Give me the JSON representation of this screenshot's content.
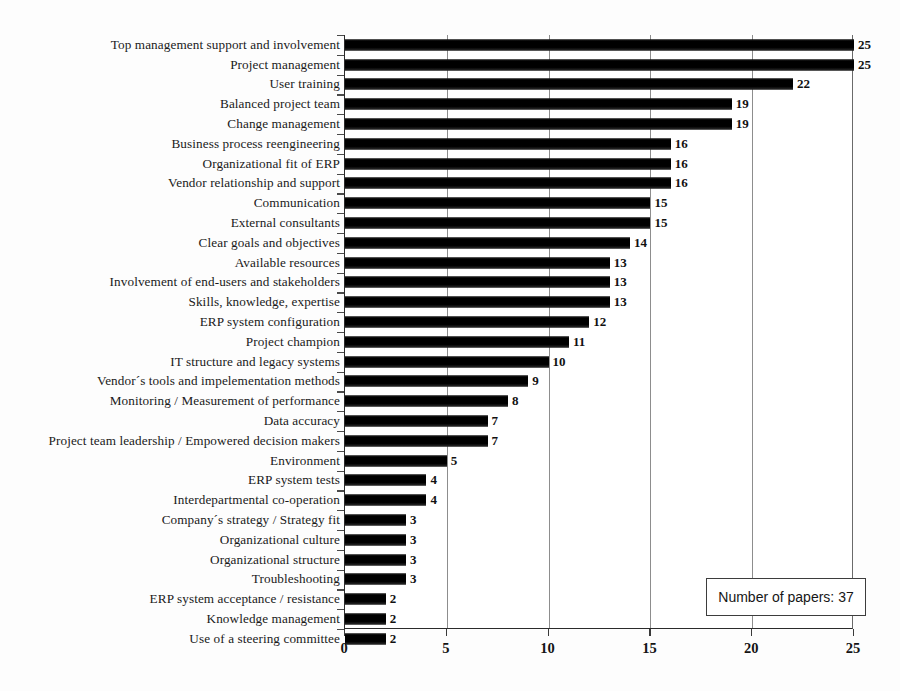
{
  "chart_data": {
    "type": "bar",
    "orientation": "horizontal",
    "title": "",
    "xlabel": "",
    "ylabel": "",
    "xlim": [
      0,
      25
    ],
    "xticks": [
      0,
      5,
      10,
      15,
      20,
      25
    ],
    "grid": true,
    "legend_position": "bottom-right",
    "annotation": "Number of papers: 37",
    "categories": [
      "Top management support and involvement",
      "Project management",
      "User training",
      "Balanced project team",
      "Change management",
      "Business process reengineering",
      "Organizational fit of ERP",
      "Vendor relationship and support",
      "Communication",
      "External consultants",
      "Clear goals and objectives",
      "Available resources",
      "Involvement of end-users and stakeholders",
      "Skills, knowledge, expertise",
      "ERP system configuration",
      "Project champion",
      "IT structure and legacy systems",
      "Vendor´s tools and impelementation methods",
      "Monitoring / Measurement of performance",
      "Data accuracy",
      "Project team leadership / Empowered decision makers",
      "Environment",
      "ERP system tests",
      "Interdepartmental co-operation",
      "Company´s strategy / Strategy fit",
      "Organizational culture",
      "Organizational structure",
      "Troubleshooting",
      "ERP system acceptance / resistance",
      "Knowledge management",
      "Use of a steering committee"
    ],
    "values": [
      25,
      25,
      22,
      19,
      19,
      16,
      16,
      16,
      15,
      15,
      14,
      13,
      13,
      13,
      12,
      11,
      10,
      9,
      8,
      7,
      7,
      5,
      4,
      4,
      3,
      3,
      3,
      3,
      2,
      2,
      2
    ],
    "bar_color": "#000000"
  },
  "legend": {
    "text": "Number of papers: 37"
  }
}
